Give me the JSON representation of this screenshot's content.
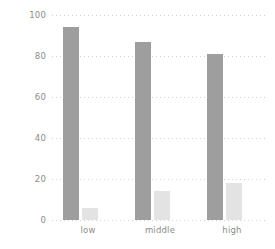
{
  "chart_data": {
    "type": "bar",
    "title": "",
    "subtitle": "",
    "xlabel": "",
    "ylabel": "",
    "categories": [
      "low",
      "middle",
      "high"
    ],
    "series": [
      {
        "name": "series-1",
        "color": "#9e9e9e",
        "values": [
          94,
          87,
          81
        ]
      },
      {
        "name": "series-2",
        "color": "#e3e3e3",
        "values": [
          6,
          14,
          18
        ]
      }
    ],
    "ylim": [
      0,
      100
    ],
    "yticks": [
      0,
      20,
      40,
      60,
      80,
      100
    ],
    "ytick_labels": [
      "0",
      "20",
      "40",
      "60",
      "80",
      "100"
    ],
    "grid": "horizontal-dotted",
    "legend": "none",
    "annotations": []
  },
  "style": {
    "background": "#ffffff",
    "grid_color": "#cfcfcf",
    "tick_label_color": "#8c8c8c"
  }
}
